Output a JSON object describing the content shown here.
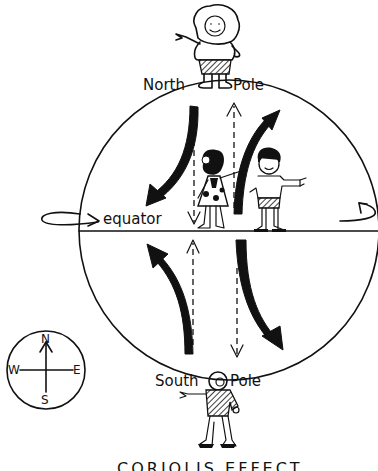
{
  "title": "CORIOLIS EFFECT",
  "labels": {
    "north": "North",
    "north_pole": "Pole",
    "south": "South",
    "south_pole": "Pole",
    "equator": "equator"
  },
  "compass": {
    "n": "N",
    "s": "S",
    "e": "E",
    "w": "W"
  },
  "arrows": {
    "northern_hemisphere": [
      "curved-left-deflection",
      "curved-right-deflection"
    ],
    "southern_hemisphere": [
      "curved-left-deflection",
      "curved-right-deflection"
    ],
    "dashed": [
      "straight-up",
      "straight-down"
    ]
  },
  "figures": [
    "north-pole-child",
    "girl",
    "boy",
    "south-pole-child"
  ],
  "colors": {
    "ink": "#111111",
    "paper": "#ffffff"
  }
}
